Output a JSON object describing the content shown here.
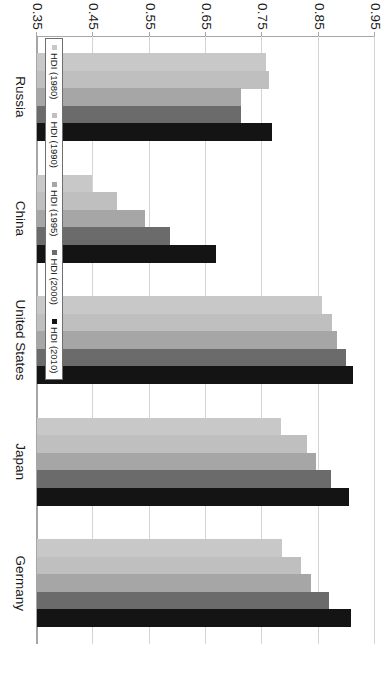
{
  "chart_data": {
    "type": "bar",
    "orientation": "horizontal",
    "title": "",
    "xlabel": "",
    "ylabel": "",
    "categories": [
      "Russia",
      "China",
      "United States",
      "Japan",
      "Germany"
    ],
    "series": [
      {
        "name": "HDI (1980)",
        "color": "#c8c8c8",
        "values": [
          0.757,
          0.448,
          0.856,
          0.783,
          0.785
        ]
      },
      {
        "name": "HDI (1990)",
        "color": "#bfbfbf",
        "values": [
          0.762,
          0.492,
          0.874,
          0.829,
          0.819
        ]
      },
      {
        "name": "HDI (1995)",
        "color": "#a6a6a6",
        "values": [
          0.713,
          0.542,
          0.883,
          0.845,
          0.836
        ]
      },
      {
        "name": "HDI (2000)",
        "color": "#6b6b6b",
        "values": [
          0.713,
          0.586,
          0.899,
          0.872,
          0.868
        ]
      },
      {
        "name": "HDI (2010)",
        "color": "#141414",
        "values": [
          0.768,
          0.668,
          0.911,
          0.904,
          0.907
        ]
      }
    ],
    "value_axis": {
      "min": 0.35,
      "max": 0.95,
      "ticks": [
        "0.95",
        "0.85",
        "0.75",
        "0.65",
        "0.55",
        "0.45",
        "0.35"
      ],
      "tick_values": [
        0.95,
        0.85,
        0.75,
        0.65,
        0.55,
        0.45,
        0.35
      ],
      "grid": true
    },
    "legend": {
      "position": "inside-left",
      "entries": [
        "HDI (1980)",
        "HDI (1990)",
        "HDI (1995)",
        "HDI (2000)",
        "HDI (2010)"
      ]
    }
  },
  "axis": {
    "tick_0": "0.95",
    "tick_1": "0.85",
    "tick_2": "0.75",
    "tick_3": "0.65",
    "tick_4": "0.55",
    "tick_5": "0.45",
    "tick_6": "0.35"
  },
  "categories": {
    "c0": "Russia",
    "c1": "China",
    "c2": "United States",
    "c3": "Japan",
    "c4": "Germany"
  },
  "legend": {
    "e0": "HDI (1980)",
    "e1": "HDI (1990)",
    "e2": "HDI (1995)",
    "e3": "HDI (2000)",
    "e4": "HDI (2010)"
  }
}
